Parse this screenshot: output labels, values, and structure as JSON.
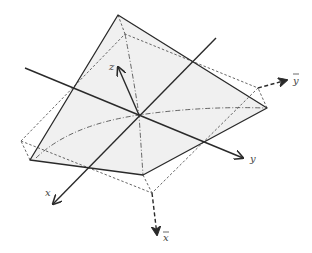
{
  "diagram": {
    "colors": {
      "line": "#2a2a2a",
      "dashed": "#444444",
      "fill": "#f0f0f0",
      "label": "#444444"
    },
    "axes": {
      "x": {
        "label": "x"
      },
      "y": {
        "label": "y"
      },
      "z": {
        "label": "z"
      },
      "x_bar": {
        "label": "x",
        "overline": true
      },
      "y_bar": {
        "label": "y",
        "overline": true
      }
    },
    "shapes": {
      "solid_surface": {
        "vertices": [
          [
            118,
            15
          ],
          [
            267,
            108
          ],
          [
            143,
            175
          ],
          [
            30,
            160
          ]
        ]
      },
      "dashed_outline": {
        "vertices": [
          [
            125,
            34
          ],
          [
            258,
            88
          ],
          [
            152,
            193
          ],
          [
            21,
            141
          ]
        ]
      }
    }
  }
}
